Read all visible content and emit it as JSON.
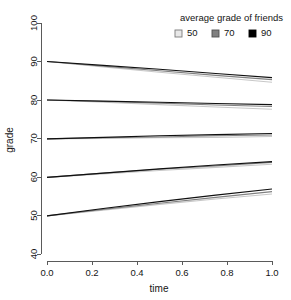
{
  "chart_data": {
    "type": "line",
    "title": "",
    "subtitle": "",
    "xlabel": "time",
    "ylabel": "grade",
    "xlim": [
      0.0,
      1.0
    ],
    "ylim": [
      40,
      100
    ],
    "xticks": [
      "0.0",
      "0.2",
      "0.4",
      "0.6",
      "0.8",
      "1.0"
    ],
    "xtick_values": [
      0.0,
      0.2,
      0.4,
      0.6,
      0.8,
      1.0
    ],
    "yticks": [
      "40",
      "50",
      "60",
      "70",
      "80",
      "90",
      "100"
    ],
    "ytick_values": [
      40,
      50,
      60,
      70,
      80,
      90,
      100
    ],
    "grid": false,
    "legend": {
      "title": "average grade of friends",
      "position": "top-right",
      "entries": [
        {
          "label": "50",
          "color": "#e8e8e8",
          "border": "#7a7a7a"
        },
        {
          "label": "70",
          "color": "#808080",
          "border": "#505050"
        },
        {
          "label": "90",
          "color": "#000000",
          "border": "#000000"
        }
      ]
    },
    "x": [
      0.0,
      0.25,
      0.5,
      0.75,
      1.0
    ],
    "series": [
      {
        "name": "start 90, friends 50",
        "friends": 50,
        "start": 90,
        "color": "#c8c8c8",
        "width": 1.1,
        "values": [
          90.0,
          88.6,
          87.2,
          85.9,
          84.6
        ]
      },
      {
        "name": "start 90, friends 70",
        "friends": 70,
        "start": 90,
        "color": "#808080",
        "width": 1.1,
        "values": [
          90.0,
          88.8,
          87.6,
          86.4,
          85.3
        ]
      },
      {
        "name": "start 90, friends 90",
        "friends": 90,
        "start": 90,
        "color": "#101010",
        "width": 1.1,
        "values": [
          90.0,
          89.0,
          88.0,
          86.9,
          85.8
        ]
      },
      {
        "name": "start 80, friends 50",
        "friends": 50,
        "start": 80,
        "color": "#c8c8c8",
        "width": 1.1,
        "values": [
          80.0,
          79.4,
          78.8,
          78.2,
          77.6
        ]
      },
      {
        "name": "start 80, friends 70",
        "friends": 70,
        "start": 80,
        "color": "#808080",
        "width": 1.1,
        "values": [
          80.0,
          79.6,
          79.2,
          78.7,
          78.3
        ]
      },
      {
        "name": "start 80, friends 90",
        "friends": 90,
        "start": 80,
        "color": "#101010",
        "width": 1.1,
        "values": [
          80.0,
          79.7,
          79.4,
          79.1,
          78.8
        ]
      },
      {
        "name": "start 70, friends 50",
        "friends": 50,
        "start": 70,
        "color": "#c8c8c8",
        "width": 1.1,
        "values": [
          69.9,
          70.0,
          70.2,
          70.3,
          70.5
        ]
      },
      {
        "name": "start 70, friends 70",
        "friends": 70,
        "start": 70,
        "color": "#808080",
        "width": 1.1,
        "values": [
          69.9,
          70.2,
          70.4,
          70.7,
          70.9
        ]
      },
      {
        "name": "start 70, friends 90",
        "friends": 90,
        "start": 70,
        "color": "#101010",
        "width": 1.1,
        "values": [
          69.9,
          70.3,
          70.7,
          71.0,
          71.3
        ]
      },
      {
        "name": "start 60, friends 50",
        "friends": 50,
        "start": 60,
        "color": "#c8c8c8",
        "width": 1.1,
        "values": [
          59.9,
          60.8,
          61.7,
          62.5,
          63.3
        ]
      },
      {
        "name": "start 60, friends 70",
        "friends": 70,
        "start": 60,
        "color": "#808080",
        "width": 1.1,
        "values": [
          59.9,
          61.0,
          62.0,
          62.9,
          63.8
        ]
      },
      {
        "name": "start 60, friends 90",
        "friends": 90,
        "start": 60,
        "color": "#101010",
        "width": 1.1,
        "values": [
          59.9,
          61.0,
          62.1,
          63.1,
          64.0
        ]
      },
      {
        "name": "start 50, friends 50",
        "friends": 50,
        "start": 50,
        "color": "#c8c8c8",
        "width": 1.1,
        "values": [
          49.9,
          51.4,
          52.9,
          54.3,
          55.6
        ]
      },
      {
        "name": "start 50, friends 70",
        "friends": 70,
        "start": 50,
        "color": "#808080",
        "width": 1.1,
        "values": [
          49.9,
          51.6,
          53.2,
          54.7,
          56.2
        ]
      },
      {
        "name": "start 50, friends 90",
        "friends": 90,
        "start": 50,
        "color": "#101010",
        "width": 1.1,
        "values": [
          49.9,
          51.8,
          53.6,
          55.3,
          56.9
        ]
      }
    ]
  }
}
